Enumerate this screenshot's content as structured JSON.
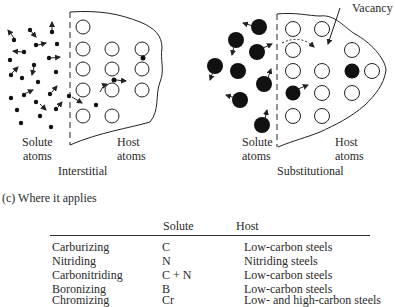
{
  "diagram": {
    "interstitial": {
      "solute_label_1": "Solute",
      "solute_label_2": "atoms",
      "host_label_1": "Host",
      "host_label_2": "atoms",
      "title": "Interstitial"
    },
    "substitutional": {
      "solute_label_1": "Solute",
      "solute_label_2": "atoms",
      "host_label_1": "Host",
      "host_label_2": "atoms",
      "title": "Substitutional",
      "vacancy_label": "Vacancy"
    }
  },
  "table": {
    "caption": "(c)  Where it applies",
    "headers": {
      "process": "",
      "solute": "Solute",
      "host": "Host"
    },
    "rows": [
      {
        "process": "Carburizing",
        "solute": "C",
        "host": "Low-carbon steels"
      },
      {
        "process": "Nitriding",
        "solute": "N",
        "host": "Nitriding steels"
      },
      {
        "process": "Carbonitriding",
        "solute": "C + N",
        "host": "Low-carbon steels"
      },
      {
        "process": "Boronizing",
        "solute": "B",
        "host": "Low-carbon steels"
      },
      {
        "process": "Chromizing",
        "solute": "Cr",
        "host": "Low- and high-carbon steels"
      }
    ]
  }
}
